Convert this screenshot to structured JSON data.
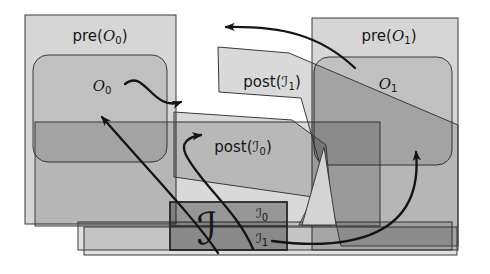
{
  "figure": {
    "background": "#ffffff",
    "shape_stroke": "#3a3a3a",
    "arrow_color": "#141414",
    "fill_tones": {
      "pre_region": "rgba(0,0,0,0.16)",
      "operator_region": "rgba(0,0,0,0.10)",
      "dark_band": "rgba(0,0,0,0.15)",
      "post_region": "rgba(0,0,0,0.15)",
      "bottom_strip": "rgba(0,0,0,0.12)",
      "intersection_box": "rgba(0,0,0,0.30)",
      "gap_triangle": "#d4d4d4"
    },
    "labels": {
      "pre_o0": {
        "prefix": "pre(",
        "symbol": "O",
        "sub": "0",
        "suffix": ")"
      },
      "pre_o1": {
        "prefix": "pre(",
        "symbol": "O",
        "sub": "1",
        "suffix": ")"
      },
      "post_i0": {
        "prefix": "post(",
        "symbol": "ℐ",
        "sub": "0",
        "suffix": ")"
      },
      "post_i1": {
        "prefix": "post(",
        "symbol": "ℐ",
        "sub": "1",
        "suffix": ")"
      },
      "o0": {
        "symbol": "O",
        "sub": "0"
      },
      "o1": {
        "symbol": "O",
        "sub": "1"
      },
      "i_big": {
        "symbol": "ℐ"
      },
      "i0": {
        "symbol": "ℐ",
        "sub": "0"
      },
      "i1": {
        "symbol": "ℐ",
        "sub": "1"
      }
    }
  }
}
